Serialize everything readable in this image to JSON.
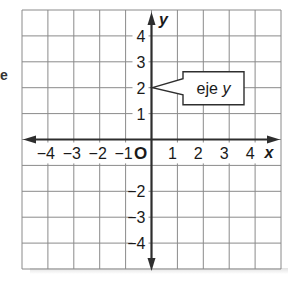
{
  "diagram": {
    "grid": {
      "x_min": -5,
      "x_max": 5,
      "y_min": -5,
      "y_max": 5,
      "cells_x": 10,
      "cells_y": 10
    },
    "axes": {
      "x_label": "x",
      "y_label": "y",
      "origin_label": "O",
      "x_ticks": [
        "−4",
        "−3",
        "−2",
        "−1",
        "1",
        "2",
        "3",
        "4"
      ],
      "x_tick_values": [
        -4,
        -3,
        -2,
        -1,
        1,
        2,
        3,
        4
      ],
      "y_ticks": [
        "4",
        "3",
        "2",
        "1",
        "−2",
        "−3",
        "−4"
      ],
      "y_tick_values": [
        4,
        3,
        2,
        1,
        -2,
        -3,
        -4
      ]
    },
    "callout": {
      "text_main": "eje ",
      "text_var": "y",
      "points_to": [
        0,
        2
      ]
    },
    "margin_mark": "e",
    "colors": {
      "grid": "#8a8a8a",
      "axis": "#2e2e2e",
      "text": "#1a1a1a",
      "background": "#ffffff"
    }
  }
}
